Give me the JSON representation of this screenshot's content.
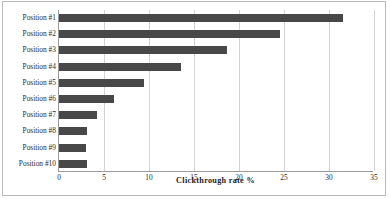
{
  "chart_data": {
    "type": "bar",
    "orientation": "horizontal",
    "title": "",
    "xlabel": "Clickthrough rate %",
    "ylabel": "",
    "xlim": [
      0,
      35
    ],
    "xticks": [
      0,
      5,
      10,
      15,
      20,
      25,
      30,
      35
    ],
    "grid": "vertical",
    "legend": "none",
    "bar_color": "#484848",
    "categories": [
      "Position #1",
      "Position #2",
      "Position #3",
      "Position #4",
      "Position #5",
      "Position #6",
      "Position #7",
      "Position #8",
      "Position #9",
      "Position #10"
    ],
    "values": [
      31.6,
      24.6,
      18.7,
      13.6,
      9.4,
      6.1,
      4.2,
      3.1,
      3.0,
      3.1
    ]
  }
}
